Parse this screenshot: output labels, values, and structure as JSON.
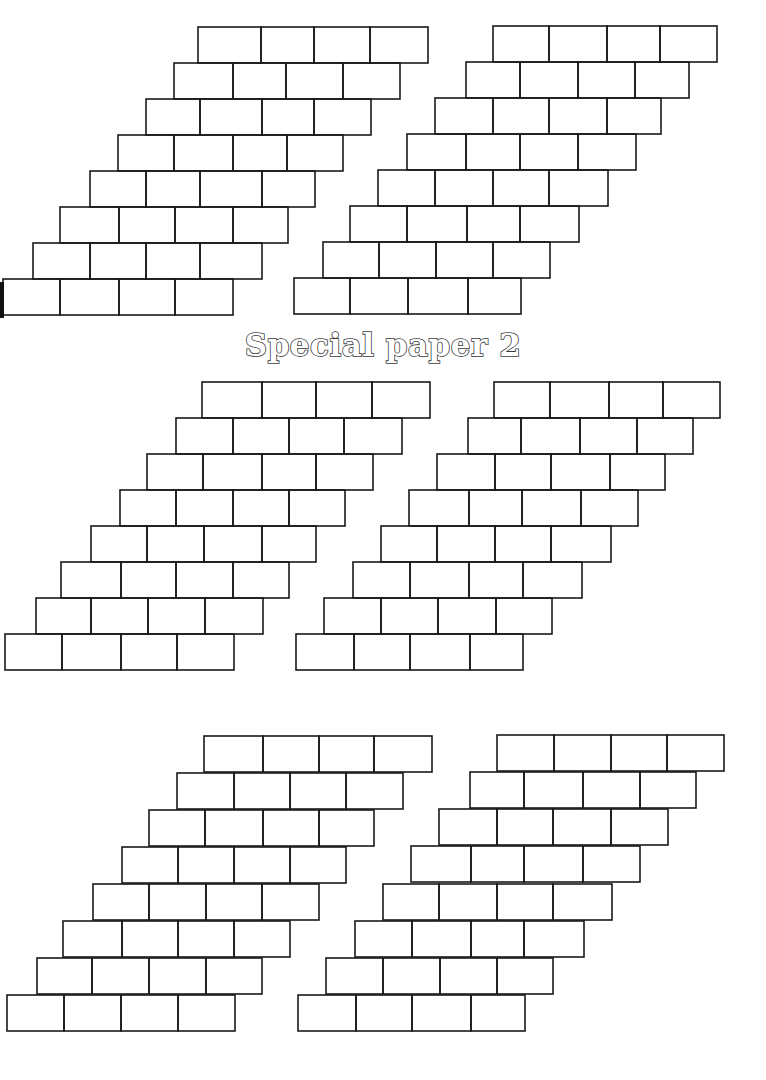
{
  "title": "Special paper 2",
  "colors": {
    "line": "#1a1a1a",
    "background": "#ffffff",
    "title_outline": "#3a3a3a"
  },
  "line_width": 1.6,
  "row_height": 36,
  "grids": [
    {
      "name": "grid-top-left",
      "rows": [
        {
          "y": 27,
          "xs": [
            198,
            261,
            314,
            370,
            428
          ]
        },
        {
          "y": 63,
          "xs": [
            174,
            233,
            286,
            343,
            400
          ]
        },
        {
          "y": 99,
          "xs": [
            146,
            200,
            262,
            314,
            371
          ]
        },
        {
          "y": 135,
          "xs": [
            118,
            174,
            233,
            287,
            343
          ]
        },
        {
          "y": 171,
          "xs": [
            90,
            146,
            200,
            262,
            315
          ]
        },
        {
          "y": 207,
          "xs": [
            60,
            119,
            175,
            233,
            288
          ]
        },
        {
          "y": 243,
          "xs": [
            33,
            90,
            146,
            200,
            262
          ]
        },
        {
          "y": 279,
          "xs": [
            3,
            60,
            119,
            175,
            233
          ]
        }
      ]
    },
    {
      "name": "grid-top-right",
      "rows": [
        {
          "y": 26,
          "xs": [
            493,
            549,
            607,
            660,
            717
          ]
        },
        {
          "y": 62,
          "xs": [
            466,
            520,
            578,
            635,
            689
          ]
        },
        {
          "y": 98,
          "xs": [
            435,
            493,
            549,
            607,
            661
          ]
        },
        {
          "y": 134,
          "xs": [
            407,
            466,
            520,
            578,
            636
          ]
        },
        {
          "y": 170,
          "xs": [
            378,
            435,
            493,
            549,
            608
          ]
        },
        {
          "y": 206,
          "xs": [
            350,
            407,
            467,
            520,
            579
          ]
        },
        {
          "y": 242,
          "xs": [
            323,
            379,
            436,
            493,
            550
          ]
        },
        {
          "y": 278,
          "xs": [
            294,
            350,
            408,
            468,
            521
          ]
        }
      ]
    },
    {
      "name": "grid-middle-left",
      "rows": [
        {
          "y": 382,
          "xs": [
            202,
            262,
            316,
            372,
            430
          ]
        },
        {
          "y": 418,
          "xs": [
            176,
            233,
            289,
            344,
            402
          ]
        },
        {
          "y": 454,
          "xs": [
            147,
            203,
            262,
            316,
            373
          ]
        },
        {
          "y": 490,
          "xs": [
            120,
            176,
            233,
            289,
            345
          ]
        },
        {
          "y": 526,
          "xs": [
            91,
            147,
            204,
            262,
            316
          ]
        },
        {
          "y": 562,
          "xs": [
            61,
            121,
            176,
            233,
            289
          ]
        },
        {
          "y": 598,
          "xs": [
            36,
            91,
            148,
            205,
            263
          ]
        },
        {
          "y": 634,
          "xs": [
            5,
            62,
            121,
            177,
            234
          ]
        }
      ]
    },
    {
      "name": "grid-middle-right",
      "rows": [
        {
          "y": 382,
          "xs": [
            494,
            550,
            609,
            663,
            720
          ]
        },
        {
          "y": 418,
          "xs": [
            468,
            521,
            580,
            637,
            693
          ]
        },
        {
          "y": 454,
          "xs": [
            437,
            495,
            551,
            610,
            665
          ]
        },
        {
          "y": 490,
          "xs": [
            409,
            469,
            522,
            581,
            638
          ]
        },
        {
          "y": 526,
          "xs": [
            381,
            437,
            495,
            551,
            611
          ]
        },
        {
          "y": 562,
          "xs": [
            353,
            410,
            469,
            523,
            582
          ]
        },
        {
          "y": 598,
          "xs": [
            324,
            381,
            438,
            496,
            552
          ]
        },
        {
          "y": 634,
          "xs": [
            296,
            354,
            410,
            470,
            523
          ]
        }
      ]
    },
    {
      "name": "grid-bottom-left",
      "rows": [
        {
          "y": 736,
          "xs": [
            204,
            263,
            319,
            374,
            432
          ]
        },
        {
          "y": 773,
          "xs": [
            177,
            234,
            290,
            346,
            403
          ]
        },
        {
          "y": 810,
          "xs": [
            149,
            205,
            263,
            319,
            374
          ]
        },
        {
          "y": 847,
          "xs": [
            122,
            178,
            234,
            290,
            346
          ]
        },
        {
          "y": 884,
          "xs": [
            93,
            149,
            206,
            262,
            319
          ]
        },
        {
          "y": 921,
          "xs": [
            63,
            122,
            178,
            234,
            290
          ]
        },
        {
          "y": 958,
          "xs": [
            37,
            92,
            149,
            206,
            262
          ]
        },
        {
          "y": 995,
          "xs": [
            7,
            64,
            121,
            178,
            235
          ]
        }
      ]
    },
    {
      "name": "grid-bottom-right",
      "rows": [
        {
          "y": 735,
          "xs": [
            497,
            554,
            611,
            667,
            724
          ]
        },
        {
          "y": 772,
          "xs": [
            470,
            524,
            583,
            640,
            696
          ]
        },
        {
          "y": 809,
          "xs": [
            439,
            497,
            553,
            611,
            668
          ]
        },
        {
          "y": 846,
          "xs": [
            411,
            471,
            524,
            583,
            640
          ]
        },
        {
          "y": 884,
          "xs": [
            383,
            439,
            497,
            553,
            612
          ]
        },
        {
          "y": 921,
          "xs": [
            355,
            412,
            471,
            524,
            584
          ]
        },
        {
          "y": 958,
          "xs": [
            326,
            383,
            440,
            497,
            553
          ]
        },
        {
          "y": 995,
          "xs": [
            298,
            356,
            412,
            471,
            525
          ]
        }
      ]
    }
  ]
}
